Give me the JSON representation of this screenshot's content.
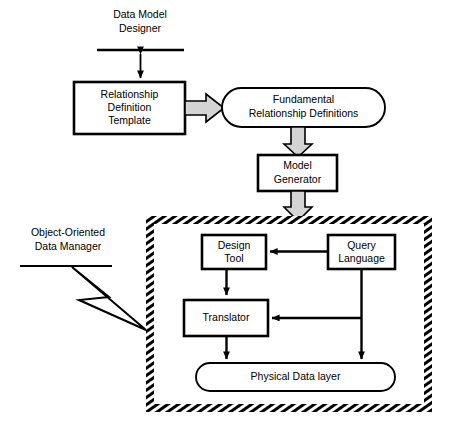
{
  "diagram": {
    "colors": {
      "stroke": "#000000",
      "background": "#ffffff",
      "block_arrow_fill": "#d4d4d4",
      "hatch": "#000000"
    },
    "annotations": [
      {
        "id": "data-model-designer",
        "lines": [
          "Data Model",
          "Designer"
        ],
        "x": 140,
        "y": 18,
        "rule": {
          "x1": 97,
          "y1": 50,
          "x2": 184,
          "y2": 50
        }
      },
      {
        "id": "object-oriented-data-manager",
        "lines": [
          "Object-Oriented",
          "Data Manager"
        ],
        "x": 68,
        "y": 232,
        "rule": {
          "x1": 20,
          "y1": 266,
          "x2": 112,
          "y2": 266
        }
      }
    ],
    "nodes": [
      {
        "id": "relationship-definition-template",
        "shape": "rect",
        "lines": [
          "Relationship",
          "Definition",
          "Template"
        ],
        "x": 74,
        "y": 82,
        "w": 111,
        "h": 52
      },
      {
        "id": "fundamental-relationship-definitions",
        "shape": "rounded",
        "lines": [
          "Fundamental",
          "Relationship Definitions"
        ],
        "x": 222,
        "y": 88,
        "w": 163,
        "h": 39
      },
      {
        "id": "model-generator",
        "shape": "rect",
        "lines": [
          "Model",
          "Generator"
        ],
        "x": 258,
        "y": 155,
        "w": 79,
        "h": 36
      },
      {
        "id": "design-tool",
        "shape": "rect",
        "lines": [
          "Design",
          "Tool"
        ],
        "x": 202,
        "y": 235,
        "w": 64,
        "h": 34
      },
      {
        "id": "query-language",
        "shape": "rect",
        "lines": [
          "Query",
          "Language"
        ],
        "x": 328,
        "y": 235,
        "w": 67,
        "h": 34
      },
      {
        "id": "translator",
        "shape": "rect",
        "lines": [
          "Translator"
        ],
        "x": 184,
        "y": 300,
        "w": 84,
        "h": 36
      },
      {
        "id": "physical-data-layer",
        "shape": "rounded",
        "lines": [
          "Physical Data layer"
        ],
        "x": 196,
        "y": 363,
        "w": 199,
        "h": 28
      }
    ],
    "container": {
      "id": "object-oriented-data-manager-boundary",
      "style": "hatched-dashed",
      "x": 146,
      "y": 216,
      "w": 286,
      "h": 196
    },
    "edges": [
      {
        "id": "designer-to-template",
        "kind": "double-arrow-line",
        "from": "data-model-designer",
        "to": "relationship-definition-template"
      },
      {
        "id": "template-to-definitions",
        "kind": "block-arrow",
        "from": "relationship-definition-template",
        "to": "fundamental-relationship-definitions"
      },
      {
        "id": "definitions-to-generator",
        "kind": "block-arrow",
        "from": "fundamental-relationship-definitions",
        "to": "model-generator"
      },
      {
        "id": "generator-to-boundary",
        "kind": "block-arrow",
        "from": "model-generator",
        "to": "object-oriented-data-manager-boundary"
      },
      {
        "id": "query-to-design",
        "kind": "arrow-line",
        "from": "query-language",
        "to": "design-tool"
      },
      {
        "id": "design-to-translator",
        "kind": "arrow-line",
        "from": "design-tool",
        "to": "translator"
      },
      {
        "id": "query-to-translator",
        "kind": "arrow-line",
        "from": "query-language",
        "to": "translator"
      },
      {
        "id": "translator-to-physical",
        "kind": "arrow-line",
        "from": "translator",
        "to": "physical-data-layer"
      },
      {
        "id": "query-to-physical",
        "kind": "arrow-line",
        "from": "query-language",
        "to": "physical-data-layer"
      },
      {
        "id": "manager-label-leader",
        "kind": "zigzag-leader",
        "from": "object-oriented-data-manager",
        "to": "object-oriented-data-manager-boundary"
      }
    ]
  }
}
